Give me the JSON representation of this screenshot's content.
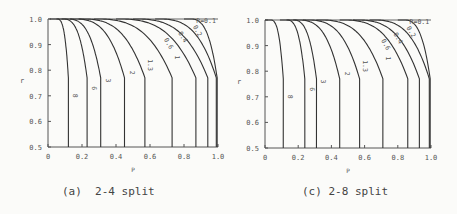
{
  "chart_data": [
    {
      "type": "line",
      "title": "",
      "caption": "(a)  2-4 split",
      "xlabel": "P",
      "ylabel": "r",
      "xlim": [
        0,
        1.0
      ],
      "ylim": [
        0.5,
        1.0
      ],
      "xticks": [
        "0",
        "0.2",
        "0.4",
        "0.6",
        "0.8",
        "1.0"
      ],
      "yticks": [
        "0.5",
        "0.6",
        "0.7",
        "0.8",
        "0.9",
        "1.0"
      ],
      "grid": false,
      "legend": "inline curve labels",
      "series": [
        {
          "name": "8",
          "asymptote_x": 0.12,
          "knee_start_x": 0.06
        },
        {
          "name": "6",
          "asymptote_x": 0.23,
          "knee_start_x": 0.1
        },
        {
          "name": "3",
          "asymptote_x": 0.31,
          "knee_start_x": 0.13
        },
        {
          "name": "2",
          "asymptote_x": 0.45,
          "knee_start_x": 0.18
        },
        {
          "name": "1.3",
          "asymptote_x": 0.57,
          "knee_start_x": 0.23
        },
        {
          "name": "1",
          "asymptote_x": 0.73,
          "knee_start_x": 0.32
        },
        {
          "name": "0.6",
          "asymptote_x": 0.87,
          "knee_start_x": 0.45
        },
        {
          "name": "0.4",
          "asymptote_x": 0.94,
          "knee_start_x": 0.55
        },
        {
          "name": "0.2",
          "asymptote_x": 0.99,
          "knee_start_x": 0.68
        },
        {
          "name": "R=0.1",
          "asymptote_x": 1.0,
          "knee_start_x": 0.85
        }
      ]
    },
    {
      "type": "line",
      "title": "",
      "caption": "(c) 2-8 split",
      "xlabel": "P",
      "ylabel": "r",
      "xlim": [
        0,
        1.0
      ],
      "ylim": [
        0.5,
        1.0
      ],
      "xticks": [
        "0",
        "0.2",
        "0.4",
        "0.6",
        "0.8",
        "1.0"
      ],
      "yticks": [
        "0.5",
        "0.6",
        "0.7",
        "0.8",
        "0.9",
        "1.0"
      ],
      "grid": false,
      "legend": "inline curve labels",
      "series": [
        {
          "name": "8",
          "asymptote_x": 0.11,
          "knee_start_x": 0.04
        },
        {
          "name": "6",
          "asymptote_x": 0.24,
          "knee_start_x": 0.14
        },
        {
          "name": "3",
          "asymptote_x": 0.31,
          "knee_start_x": 0.18
        },
        {
          "name": "2",
          "asymptote_x": 0.45,
          "knee_start_x": 0.22
        },
        {
          "name": "1.3",
          "asymptote_x": 0.57,
          "knee_start_x": 0.28
        },
        {
          "name": "1",
          "asymptote_x": 0.71,
          "knee_start_x": 0.36
        },
        {
          "name": "0.6",
          "asymptote_x": 0.86,
          "knee_start_x": 0.5
        },
        {
          "name": "0.4",
          "asymptote_x": 0.93,
          "knee_start_x": 0.58
        },
        {
          "name": "0.2",
          "asymptote_x": 0.99,
          "knee_start_x": 0.68
        },
        {
          "name": "R=0.1",
          "asymptote_x": 1.0,
          "knee_start_x": 0.85
        }
      ]
    }
  ]
}
